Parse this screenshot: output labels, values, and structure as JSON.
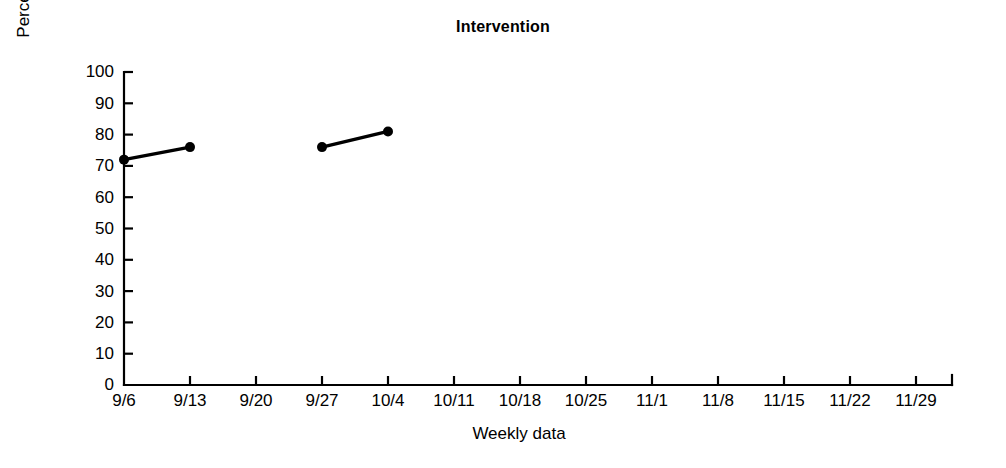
{
  "chart_data": {
    "type": "line",
    "title": "Intervention",
    "xlabel": "Weekly data",
    "ylabel": "Percentage of independence",
    "grid": false,
    "legend": "none",
    "ylim": [
      0,
      100
    ],
    "yticks": [
      0,
      10,
      20,
      30,
      40,
      50,
      60,
      70,
      80,
      90,
      100
    ],
    "ytick_labels": [
      "0",
      "10",
      "20",
      "30",
      "40",
      "50",
      "60",
      "70",
      "80",
      "90",
      "100"
    ],
    "categories": [
      "9/6",
      "9/13",
      "9/20",
      "9/27",
      "10/4",
      "10/11",
      "10/18",
      "10/25",
      "11/1",
      "11/8",
      "11/15",
      "11/22",
      "11/29"
    ],
    "series": [
      {
        "name": "Percentage of independence",
        "marker": "filled-circle",
        "color": "#000000",
        "points": [
          {
            "x": "9/6",
            "y": 72
          },
          {
            "x": "9/13",
            "y": 76
          },
          {
            "x": "9/20",
            "y": null
          },
          {
            "x": "9/27",
            "y": 76
          },
          {
            "x": "10/4",
            "y": 81
          },
          {
            "x": "10/11",
            "y": null
          },
          {
            "x": "10/18",
            "y": null
          },
          {
            "x": "10/25",
            "y": null
          },
          {
            "x": "11/1",
            "y": null
          },
          {
            "x": "11/8",
            "y": null
          },
          {
            "x": "11/15",
            "y": null
          },
          {
            "x": "11/22",
            "y": null
          },
          {
            "x": "11/29",
            "y": null
          }
        ]
      }
    ]
  }
}
